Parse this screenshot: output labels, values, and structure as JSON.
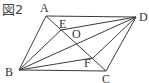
{
  "figure": {
    "title": "図2",
    "stroke_color": "#3a3a3a",
    "points": {
      "A": {
        "x": 46,
        "y": 16,
        "label": "A",
        "lx": 40,
        "ly": 12
      },
      "D": {
        "x": 136,
        "y": 17,
        "label": "D",
        "lx": 139,
        "ly": 21
      },
      "B": {
        "x": 19,
        "y": 70,
        "label": "B",
        "lx": 5,
        "ly": 76
      },
      "C": {
        "x": 106,
        "y": 71,
        "label": "C",
        "lx": 102,
        "ly": 83
      },
      "E": {
        "x": 61,
        "y": 30,
        "label": "E",
        "lx": 59,
        "ly": 28
      },
      "O": {
        "x": 77,
        "y": 43,
        "label": "O",
        "lx": 72,
        "ly": 38
      },
      "F": {
        "x": 93,
        "y": 58,
        "label": "F",
        "lx": 84,
        "ly": 67
      }
    },
    "segments": [
      [
        "A",
        "D"
      ],
      [
        "A",
        "B"
      ],
      [
        "B",
        "C"
      ],
      [
        "C",
        "D"
      ],
      [
        "A",
        "C"
      ],
      [
        "B",
        "D"
      ],
      [
        "B",
        "E"
      ],
      [
        "E",
        "D"
      ],
      [
        "B",
        "F"
      ],
      [
        "F",
        "D"
      ]
    ]
  }
}
